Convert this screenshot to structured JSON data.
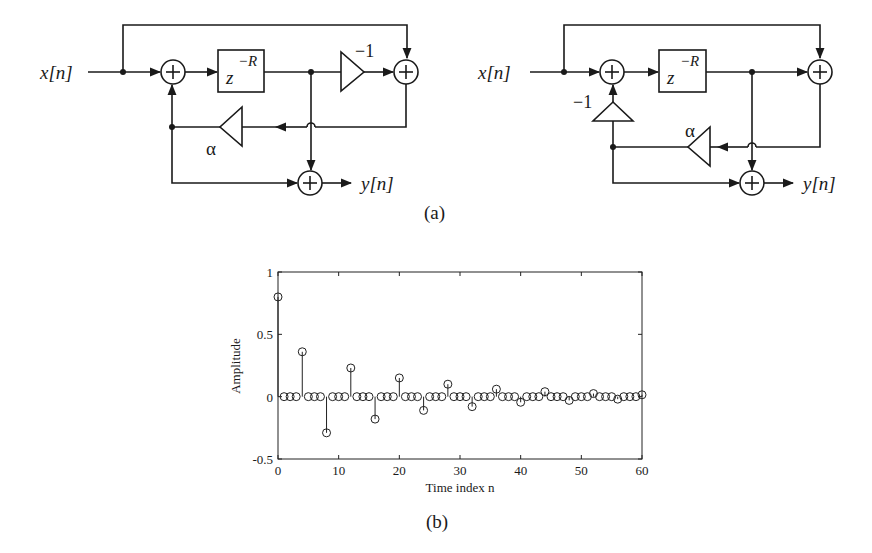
{
  "figure": {
    "caption_a": "(a)",
    "caption_b": "(b)"
  },
  "diagram_left": {
    "input_label": "x[n]",
    "output_label": "y[n]",
    "delay_label": "z",
    "delay_exponent": "−R",
    "gain_forward": "−1",
    "gain_feedback": "α",
    "adder_symbol": "+"
  },
  "diagram_right": {
    "input_label": "x[n]",
    "output_label": "y[n]",
    "delay_label": "z",
    "delay_exponent": "−R",
    "gain_inverter": "−1",
    "gain_feedback": "α",
    "adder_symbol": "+"
  },
  "chart_data": {
    "type": "stem",
    "title": "",
    "xlabel": "Time index n",
    "ylabel": "Amplitude",
    "xlim": [
      0,
      60
    ],
    "ylim": [
      -0.5,
      1
    ],
    "xticks": [
      0,
      10,
      20,
      30,
      40,
      50,
      60
    ],
    "xtick_labels": [
      "0",
      "10",
      "20",
      "30",
      "40",
      "50",
      "60"
    ],
    "yticks": [
      -0.5,
      0,
      0.5,
      1
    ],
    "ytick_labels": [
      "-0.5",
      "0",
      "0.5",
      "1"
    ],
    "grid": false,
    "marker": "circle-open",
    "x": [
      0,
      1,
      2,
      3,
      4,
      5,
      6,
      7,
      8,
      9,
      10,
      11,
      12,
      13,
      14,
      15,
      16,
      17,
      18,
      19,
      20,
      21,
      22,
      23,
      24,
      25,
      26,
      27,
      28,
      29,
      30,
      31,
      32,
      33,
      34,
      35,
      36,
      37,
      38,
      39,
      40,
      41,
      42,
      43,
      44,
      45,
      46,
      47,
      48,
      49,
      50,
      51,
      52,
      53,
      54,
      55,
      56,
      57,
      58,
      59,
      60
    ],
    "values": [
      0.8,
      0,
      0,
      0,
      0.36,
      0,
      0,
      0,
      -0.29,
      0,
      0,
      0,
      0.23,
      0,
      0,
      0,
      -0.18,
      0,
      0,
      0,
      0.15,
      0,
      0,
      0,
      -0.11,
      0,
      0,
      0,
      0.1,
      0,
      0,
      0,
      -0.08,
      0,
      0,
      0,
      0.06,
      0,
      0,
      0,
      -0.045,
      0,
      0,
      0,
      0.04,
      0,
      0,
      0,
      -0.03,
      0,
      0,
      0,
      0.025,
      0,
      0,
      0,
      -0.02,
      0,
      0,
      0,
      0.015
    ]
  }
}
